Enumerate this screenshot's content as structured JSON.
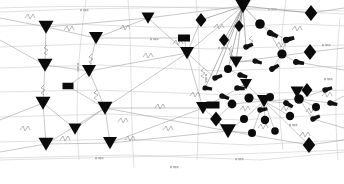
{
  "diagram": {
    "background_color": "#ffffff",
    "edge_color": "#9a9a9a",
    "node_color": "#0b0b0b",
    "label_color": "#b9b9b9",
    "width": 344,
    "height": 184,
    "legend_note": "",
    "node_shape_kinds": [
      "triangle-down",
      "diamond",
      "circle",
      "rectangle",
      "tadpole"
    ],
    "counts": {
      "triangles": 14,
      "diamonds": 6,
      "circles": 13,
      "rectangles": 3,
      "tadpoles": 16
    }
  },
  "chart_data": {
    "type": "scatter",
    "xlabel": "",
    "ylabel": "",
    "xlim": [
      0,
      344
    ],
    "ylim": [
      0,
      184
    ],
    "grid": false,
    "legend": "none",
    "nodes": [
      {
        "id": "t1",
        "shape": "triangle-down",
        "x": 46,
        "y": 27,
        "size": 7.5
      },
      {
        "id": "t2",
        "shape": "triangle-down",
        "x": 45,
        "y": 65,
        "size": 7.5
      },
      {
        "id": "t3",
        "shape": "triangle-down",
        "x": 43,
        "y": 103,
        "size": 7.5
      },
      {
        "id": "t4",
        "shape": "triangle-down",
        "x": 46,
        "y": 144,
        "size": 7.5
      },
      {
        "id": "t5",
        "shape": "triangle-down",
        "x": 96,
        "y": 38,
        "size": 7.0
      },
      {
        "id": "t6",
        "shape": "triangle-down",
        "x": 89,
        "y": 71,
        "size": 7.0
      },
      {
        "id": "t7",
        "shape": "triangle-down",
        "x": 105,
        "y": 108,
        "size": 7.5
      },
      {
        "id": "t8",
        "shape": "triangle-down",
        "x": 75,
        "y": 129,
        "size": 6.5
      },
      {
        "id": "t9",
        "shape": "triangle-down",
        "x": 110,
        "y": 143,
        "size": 7.0
      },
      {
        "id": "t10",
        "shape": "triangle-down",
        "x": 148,
        "y": 18,
        "size": 6.5
      },
      {
        "id": "t11",
        "shape": "triangle-down",
        "x": 187,
        "y": 53,
        "size": 7.0
      },
      {
        "id": "t12",
        "shape": "triangle-down",
        "x": 203,
        "y": 108,
        "size": 7.0
      },
      {
        "id": "t13",
        "shape": "triangle-down",
        "x": 243,
        "y": 6,
        "size": 8.0
      },
      {
        "id": "t14",
        "shape": "triangle-down",
        "x": 236,
        "y": 62,
        "size": 6.5
      },
      {
        "id": "t15",
        "shape": "triangle-down",
        "x": 228,
        "y": 131,
        "size": 8.0
      },
      {
        "id": "t16",
        "shape": "triangle-down",
        "x": 264,
        "y": 101,
        "size": 7.0
      },
      {
        "id": "t17",
        "shape": "triangle-down",
        "x": 246,
        "y": 84,
        "size": 6.0
      },
      {
        "id": "t18",
        "shape": "triangle-down",
        "x": 297,
        "y": 92,
        "size": 6.5
      },
      {
        "id": "d1",
        "shape": "diamond",
        "x": 311,
        "y": 13,
        "size": 8.0
      },
      {
        "id": "d2",
        "shape": "diamond",
        "x": 310,
        "y": 52,
        "size": 8.0
      },
      {
        "id": "d3",
        "shape": "diamond",
        "x": 307,
        "y": 90,
        "size": 7.0
      },
      {
        "id": "d4",
        "shape": "diamond",
        "x": 309,
        "y": 145,
        "size": 8.0
      },
      {
        "id": "d5",
        "shape": "diamond",
        "x": 201,
        "y": 20,
        "size": 7.0
      },
      {
        "id": "d6",
        "shape": "diamond",
        "x": 224,
        "y": 40,
        "size": 6.5
      },
      {
        "id": "d7",
        "shape": "diamond",
        "x": 216,
        "y": 119,
        "size": 7.5
      },
      {
        "id": "d8",
        "shape": "diamond",
        "x": 239,
        "y": 26,
        "size": 6.0
      },
      {
        "id": "c1",
        "shape": "circle",
        "x": 260,
        "y": 24,
        "r": 4.8
      },
      {
        "id": "c2",
        "shape": "circle",
        "x": 282,
        "y": 54,
        "r": 4.6
      },
      {
        "id": "c3",
        "shape": "circle",
        "x": 228,
        "y": 69,
        "r": 4.0
      },
      {
        "id": "c4",
        "shape": "circle",
        "x": 249,
        "y": 98,
        "r": 4.6
      },
      {
        "id": "c5",
        "shape": "circle",
        "x": 265,
        "y": 120,
        "r": 4.2
      },
      {
        "id": "c6",
        "shape": "circle",
        "x": 290,
        "y": 116,
        "r": 4.2
      },
      {
        "id": "c7",
        "shape": "circle",
        "x": 299,
        "y": 99,
        "r": 4.8
      },
      {
        "id": "c8",
        "shape": "circle",
        "x": 270,
        "y": 97,
        "r": 4.0
      },
      {
        "id": "c9",
        "shape": "circle",
        "x": 232,
        "y": 104,
        "r": 4.4
      },
      {
        "id": "c10",
        "shape": "circle",
        "x": 252,
        "y": 133,
        "r": 4.0
      },
      {
        "id": "c11",
        "shape": "circle",
        "x": 316,
        "y": 107,
        "r": 4.0
      },
      {
        "id": "c12",
        "shape": "circle",
        "x": 275,
        "y": 131,
        "r": 3.8
      },
      {
        "id": "c13",
        "shape": "circle",
        "x": 244,
        "y": 119,
        "r": 4.0
      },
      {
        "id": "r1",
        "shape": "rectangle",
        "x": 68,
        "y": 86,
        "w": 11,
        "h": 6.5
      },
      {
        "id": "r2",
        "shape": "rectangle",
        "x": 184,
        "y": 38,
        "w": 12,
        "h": 7.0
      },
      {
        "id": "r3",
        "shape": "rectangle",
        "x": 213,
        "y": 105,
        "w": 13,
        "h": 7.0
      },
      {
        "id": "p1",
        "shape": "tadpole",
        "x": 270,
        "y": 33,
        "size": 5.0,
        "angle": 25
      },
      {
        "id": "p2",
        "shape": "tadpole",
        "x": 286,
        "y": 40,
        "size": 5.0,
        "angle": -15
      },
      {
        "id": "p3",
        "shape": "tadpole",
        "x": 296,
        "y": 62,
        "size": 4.8,
        "angle": 10
      },
      {
        "id": "p4",
        "shape": "tadpole",
        "x": 272,
        "y": 69,
        "size": 4.6,
        "angle": -30
      },
      {
        "id": "p5",
        "shape": "tadpole",
        "x": 240,
        "y": 75,
        "size": 4.4,
        "angle": 15
      },
      {
        "id": "p6",
        "shape": "tadpole",
        "x": 215,
        "y": 78,
        "size": 4.4,
        "angle": -20
      },
      {
        "id": "p7",
        "shape": "tadpole",
        "x": 237,
        "y": 88,
        "size": 4.6,
        "angle": 5
      },
      {
        "id": "p8",
        "shape": "tadpole",
        "x": 222,
        "y": 96,
        "size": 4.4,
        "angle": 20
      },
      {
        "id": "p9",
        "shape": "tadpole",
        "x": 260,
        "y": 110,
        "size": 4.4,
        "angle": -10
      },
      {
        "id": "p10",
        "shape": "tadpole",
        "x": 286,
        "y": 103,
        "size": 4.6,
        "angle": 30
      },
      {
        "id": "p11",
        "shape": "tadpole",
        "x": 313,
        "y": 119,
        "size": 4.4,
        "angle": -25
      },
      {
        "id": "p12",
        "shape": "tadpole",
        "x": 330,
        "y": 103,
        "size": 4.4,
        "angle": 12
      },
      {
        "id": "p13",
        "shape": "tadpole",
        "x": 325,
        "y": 90,
        "size": 4.4,
        "angle": -18
      },
      {
        "id": "p14",
        "shape": "tadpole",
        "x": 205,
        "y": 88,
        "size": 4.2,
        "angle": 8
      },
      {
        "id": "p15",
        "shape": "tadpole",
        "x": 246,
        "y": 47,
        "size": 4.4,
        "angle": -22
      },
      {
        "id": "p16",
        "shape": "tadpole",
        "x": 255,
        "y": 61,
        "size": 4.2,
        "angle": 18
      }
    ],
    "edges": [
      {
        "from": "t1",
        "to": "t2"
      },
      {
        "from": "t2",
        "to": "t3"
      },
      {
        "from": "t3",
        "to": "t4"
      },
      {
        "from": "t1",
        "to": "t5"
      },
      {
        "from": "t5",
        "to": "t6"
      },
      {
        "from": "t6",
        "to": "t7"
      },
      {
        "from": "t7",
        "to": "t9"
      },
      {
        "from": "t8",
        "to": "t7"
      },
      {
        "from": "t5",
        "to": "t10"
      },
      {
        "from": "t10",
        "to": "t13"
      },
      {
        "from": "t11",
        "to": "t13"
      },
      {
        "from": "t11",
        "to": "t12"
      },
      {
        "from": "t12",
        "to": "t15"
      },
      {
        "from": "t13",
        "to": "d1"
      },
      {
        "from": "t13",
        "to": "c1"
      },
      {
        "from": "d2",
        "to": "t14"
      },
      {
        "from": "t16",
        "to": "c7"
      },
      {
        "from": "t15",
        "to": "d7"
      },
      {
        "from": "t18",
        "to": "d4"
      },
      {
        "from": "r1",
        "to": "t7"
      },
      {
        "from": "r2",
        "to": "t11"
      },
      {
        "from": "r3",
        "to": "t12"
      }
    ],
    "labels": [
      {
        "x": 80,
        "y": 9,
        "text": "",
        "style": "tick-marks"
      },
      {
        "x": 268,
        "y": 8,
        "text": "",
        "style": "tick-marks"
      },
      {
        "x": 77,
        "y": 63,
        "text": "",
        "style": "tick-marks-vertical"
      },
      {
        "x": 205,
        "y": 74,
        "text": "",
        "style": "tick-marks-vertical"
      },
      {
        "x": 218,
        "y": 47,
        "text": "",
        "style": "tick-marks"
      },
      {
        "x": 95,
        "y": 157,
        "text": "",
        "style": "tick-marks"
      },
      {
        "x": 170,
        "y": 166,
        "text": "",
        "style": "tick-marks"
      },
      {
        "x": 235,
        "y": 158,
        "text": "",
        "style": "tick-marks"
      },
      {
        "x": 322,
        "y": 44,
        "text": "",
        "style": "tick-marks"
      },
      {
        "x": 324,
        "y": 78,
        "text": "",
        "style": "tick-marks"
      },
      {
        "x": 289,
        "y": 124,
        "text": "",
        "style": "tick-marks"
      },
      {
        "x": 150,
        "y": 38,
        "text": "",
        "style": "tick-marks"
      }
    ]
  }
}
